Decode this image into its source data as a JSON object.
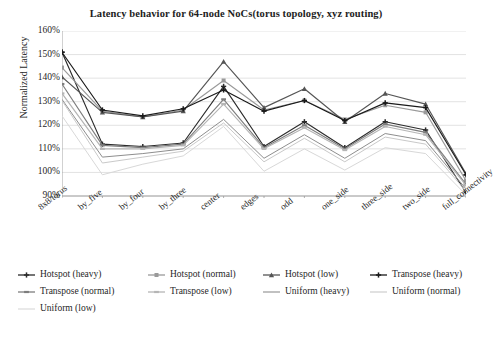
{
  "chart_data": {
    "type": "line",
    "title": "Latency behavior for 64-node NoCs(torus topology, xyz routing)",
    "xlabel": "",
    "ylabel": "Normalized Latency",
    "ylim": [
      90,
      160
    ],
    "ytick_step": 10,
    "ytick_labels": [
      "160%",
      "150%",
      "140%",
      "130%",
      "120%",
      "110%",
      "100%",
      "90%"
    ],
    "ytick_values": [
      160,
      150,
      140,
      130,
      120,
      110,
      100,
      90
    ],
    "grid": true,
    "legend_position": "bottom",
    "categories": [
      "8x8/torus",
      "by_five",
      "by_four",
      "by_three",
      "center",
      "edges",
      "odd",
      "one_side",
      "three_side",
      "two_side",
      "full_connectivity"
    ],
    "series": [
      {
        "name": "Hotspot (heavy)",
        "color": "#2b2b2b",
        "marker": "cross",
        "values": [
          151.0,
          112.0,
          111.0,
          112.5,
          136.5,
          111.0,
          121.5,
          110.5,
          121.5,
          118.0,
          91.5
        ]
      },
      {
        "name": "Hotspot (normal)",
        "color": "#9a9a9a",
        "marker": "square",
        "values": [
          144.5,
          126.0,
          123.5,
          126.5,
          139.0,
          126.5,
          130.5,
          122.5,
          128.5,
          125.5,
          96.5
        ]
      },
      {
        "name": "Hotspot (low)",
        "color": "#555555",
        "marker": "triangle",
        "values": [
          140.5,
          125.5,
          123.5,
          126.0,
          147.0,
          127.5,
          135.5,
          121.5,
          133.5,
          129.0,
          99.5
        ]
      },
      {
        "name": "Transpose (heavy)",
        "color": "#1a1a1a",
        "marker": "cross",
        "values": [
          151.0,
          126.5,
          124.0,
          127.0,
          135.0,
          126.0,
          130.5,
          122.0,
          129.5,
          127.5,
          99.0
        ]
      },
      {
        "name": "Transpose (normal)",
        "color": "#7d7d7d",
        "marker": "dash",
        "values": [
          137.5,
          111.5,
          110.5,
          112.0,
          131.0,
          110.5,
          120.0,
          110.0,
          120.5,
          117.0,
          95.0
        ]
      },
      {
        "name": "Transpose (low)",
        "color": "#b5b5b5",
        "marker": "dash",
        "values": [
          133.5,
          110.0,
          110.0,
          111.5,
          129.0,
          110.0,
          119.0,
          109.5,
          119.5,
          116.0,
          94.5
        ]
      },
      {
        "name": "Uniform (heavy)",
        "color": "#8e8e8e",
        "marker": "line",
        "values": [
          131.0,
          106.5,
          108.0,
          110.0,
          122.5,
          106.0,
          116.0,
          106.0,
          116.5,
          113.5,
          93.0
        ]
      },
      {
        "name": "Uniform (normal)",
        "color": "#c9c9c9",
        "marker": "line",
        "values": [
          130.5,
          104.0,
          106.5,
          109.0,
          121.0,
          104.5,
          114.5,
          104.5,
          115.0,
          112.0,
          92.0
        ]
      },
      {
        "name": "Uniform (low)",
        "color": "#d8d8d8",
        "marker": "line",
        "values": [
          124.0,
          99.0,
          103.5,
          107.0,
          119.5,
          100.5,
          110.0,
          101.0,
          110.5,
          108.0,
          90.5
        ]
      }
    ]
  }
}
